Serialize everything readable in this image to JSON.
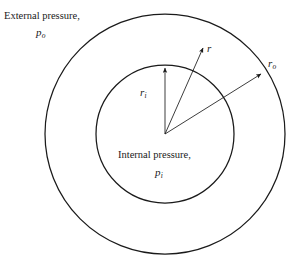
{
  "figure": {
    "geometry": {
      "center_x": 165,
      "center_y": 134,
      "inner_radius": 69,
      "outer_radius": 120,
      "stroke_color": "#1a1a1a",
      "background_color": "#ffffff"
    },
    "labels": {
      "external_pressure": "External pressure,",
      "external_pressure_symbol": "p",
      "external_pressure_subscript": "o",
      "internal_pressure": "Internal pressure,",
      "internal_pressure_symbol": "p",
      "internal_pressure_subscript": "i",
      "inner_radius_symbol": "r",
      "inner_radius_subscript": "i",
      "radius_symbol": "r",
      "outer_radius_symbol": "r",
      "outer_radius_subscript": "o"
    },
    "arrows": [
      {
        "name": "inner-radius-arrow",
        "label": "r_i",
        "from_x": 165,
        "from_y": 134,
        "to_x": 165,
        "to_y": 66
      },
      {
        "name": "radius-arrow",
        "label": "r",
        "from_x": 165,
        "from_y": 134,
        "to_x": 204,
        "to_y": 46
      },
      {
        "name": "outer-radius-arrow",
        "label": "r_o",
        "from_x": 165,
        "from_y": 134,
        "to_x": 263,
        "to_y": 73
      }
    ]
  }
}
